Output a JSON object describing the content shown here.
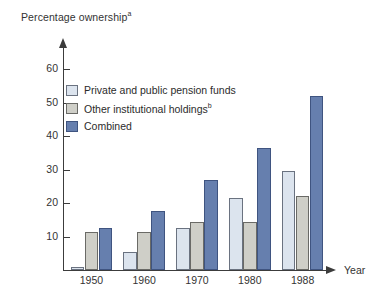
{
  "chart_data": {
    "type": "bar",
    "title": "",
    "ylabel": "Percentage ownership",
    "ylabel_superscript": "a",
    "xlabel": "Year",
    "categories": [
      "1950",
      "1960",
      "1970",
      "1980",
      "1988"
    ],
    "ylim": [
      0,
      65
    ],
    "yticks": [
      10,
      20,
      30,
      40,
      50,
      60
    ],
    "grid": false,
    "legend_position": "top-left inside plot",
    "series": [
      {
        "name": "Private and public pension funds",
        "color": "#dce4ee",
        "values": [
          1,
          5.5,
          12.5,
          21.5,
          29.5
        ]
      },
      {
        "name": "Other institutional holdings",
        "name_superscript": "b",
        "color": "#cfcfc8",
        "values": [
          11.5,
          11.5,
          14.5,
          14.5,
          22
        ]
      },
      {
        "name": "Combined",
        "color": "#667fae",
        "values": [
          12.5,
          17.5,
          27,
          36.5,
          52
        ]
      }
    ]
  }
}
